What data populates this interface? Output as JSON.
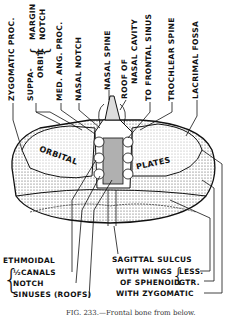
{
  "figure": {
    "subject": "Frontal bone from below",
    "caption": "FIG. 233.—Frontal bone from below."
  },
  "top_labels": [
    {
      "id": "zygomatic-proc",
      "text": "ZYGOMATIC PROC."
    },
    {
      "id": "suppa-orbit",
      "text_a": "SUPPA-",
      "text_b": "ORBIT."
    },
    {
      "id": "margin",
      "text": "MARGIN"
    },
    {
      "id": "notch",
      "text": "NOTCH"
    },
    {
      "id": "med-ang-proc",
      "text": "MED. ANG. PROC."
    },
    {
      "id": "nasal-notch",
      "text": "NASAL NOTCH"
    },
    {
      "id": "nasal-spine",
      "text": "NASAL SPINE"
    },
    {
      "id": "roof-of",
      "text": "ROOF OF"
    },
    {
      "id": "nasal-cavity",
      "text": "NASAL CAVITY"
    },
    {
      "id": "to-frontal-sinus",
      "text": "TO FRONTAL SINUS"
    },
    {
      "id": "trochlear-spine",
      "text": "TROCHLEAR SPINE"
    },
    {
      "id": "lacrimal-fossa",
      "text": "LACRIMAL FOSSA"
    }
  ],
  "inline_labels": {
    "orbital": "ORBITAL",
    "plates": "PLATES"
  },
  "bottom_left": {
    "title": "ETHMOIDAL",
    "items": [
      "½CANALS",
      "NOTCH",
      "SINUSES (ROOFS)"
    ]
  },
  "bottom_right": {
    "sagittal": "SAGITTAL SULCUS",
    "with_wings": "WITH WINGS",
    "of_sphenoid": "OF SPHENOID",
    "less": "LESS.",
    "gtr": "GTR.",
    "with_zygomatic": "WITH ZYGOMATIC"
  }
}
